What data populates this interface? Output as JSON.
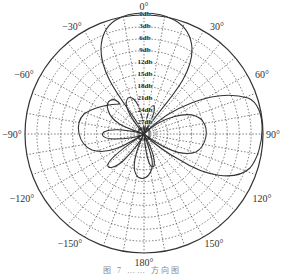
{
  "chart_data": {
    "type": "polar-line",
    "title": "",
    "angle_unit": "degrees",
    "angle_zero": "top",
    "angle_direction": "clockwise",
    "angle_tick_labels": [
      "0°",
      "30°",
      "60°",
      "90°",
      "120°",
      "150°",
      "180°",
      "-150°",
      "-120°",
      "-90°",
      "-60°",
      "-30°"
    ],
    "angle_ticks": [
      0,
      30,
      60,
      90,
      120,
      150,
      180,
      -150,
      -120,
      -90,
      -60,
      -30
    ],
    "radial_tick_labels": [
      "0db",
      "3db",
      "6db",
      "9db",
      "12db",
      "15db",
      "18db",
      "21db",
      "24db",
      "27db"
    ],
    "radial_range_db": [
      -30,
      0
    ],
    "grid": {
      "radial_step_deg": 10,
      "ring_step_db": 3,
      "style": "dotted"
    },
    "series": [
      {
        "name": "radiation pattern",
        "description": "Multi-lobe antenna pattern: main lobe at 0°, large side lobe near 100°, secondary lobes near -75°, -90°, 180°, -150°, 90°",
        "points_deg_db": [
          [
            0,
            0
          ],
          [
            10,
            -0.5
          ],
          [
            20,
            -3
          ],
          [
            25,
            -6
          ],
          [
            30,
            -12
          ],
          [
            35,
            -22
          ],
          [
            40,
            -28
          ],
          [
            50,
            -26
          ],
          [
            60,
            -18
          ],
          [
            70,
            -8
          ],
          [
            80,
            -2
          ],
          [
            90,
            -0.5
          ],
          [
            100,
            0
          ],
          [
            110,
            -2
          ],
          [
            115,
            -5
          ],
          [
            120,
            -14
          ],
          [
            125,
            -25
          ],
          [
            140,
            -27
          ],
          [
            160,
            -22
          ],
          [
            175,
            -15
          ],
          [
            180,
            -14
          ],
          [
            185,
            -15
          ],
          [
            195,
            -22
          ],
          [
            205,
            -27
          ],
          [
            215,
            -20
          ],
          [
            220,
            -17
          ],
          [
            230,
            -19
          ],
          [
            235,
            -25
          ],
          [
            255,
            -17
          ],
          [
            265,
            -16
          ],
          [
            270,
            -16
          ],
          [
            275,
            -16
          ],
          [
            280,
            -18
          ],
          [
            285,
            -15
          ],
          [
            290,
            -12
          ],
          [
            295,
            -12
          ],
          [
            300,
            -17
          ],
          [
            310,
            -24
          ],
          [
            320,
            -22
          ],
          [
            330,
            -14
          ],
          [
            340,
            -6
          ],
          [
            350,
            -1.5
          ],
          [
            360,
            0
          ]
        ]
      }
    ],
    "legend": null
  },
  "labels": {
    "a0": "0°",
    "a30": "30°",
    "a60": "60°",
    "a90": "90°",
    "a120": "120°",
    "a150": "150°",
    "a180": "180°",
    "am150": "−150°",
    "am120": "−120°",
    "am90": "−90°",
    "am60": "−60°",
    "am30": "−30°",
    "r0": "0db",
    "r3": "3db",
    "r6": "6db",
    "r9": "9db",
    "r12": "12db",
    "r15": "15db",
    "r18": "18db",
    "r21": "21db",
    "r24": "24db",
    "r27": "27db"
  },
  "caption": "图 7 …… 方向图"
}
